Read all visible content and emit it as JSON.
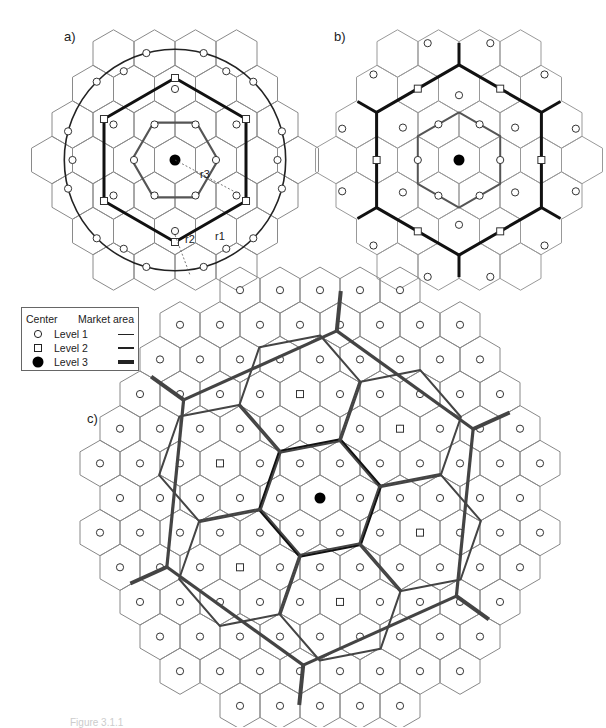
{
  "panels": {
    "a": {
      "label": "a)",
      "radius_labels": [
        "r1",
        "r2",
        "r3"
      ]
    },
    "b": {
      "label": "b)"
    },
    "c": {
      "label": "c)"
    }
  },
  "legend": {
    "center_header": "Center",
    "market_header": "Market area",
    "rows": [
      {
        "symbol": "open-circle",
        "label": "Level 1",
        "line_weight": 1
      },
      {
        "symbol": "open-square",
        "label": "Level 2",
        "line_weight": 2
      },
      {
        "symbol": "filled-circle",
        "label": "Level 3",
        "line_weight": 3.5
      }
    ]
  },
  "caption": "Figure 3.1.1",
  "colors": {
    "thin": "#8a8a8a",
    "medium": "#555555",
    "thick": "#111111",
    "center": "#000000"
  }
}
